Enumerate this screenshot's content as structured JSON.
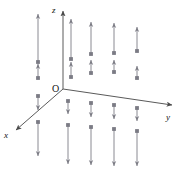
{
  "figure": {
    "title": "",
    "width": 187,
    "height": 187,
    "background_color": "#ffffff"
  },
  "colors": {
    "axis": "#5a5a5a",
    "vector": "#8a8a92",
    "vector_head": "#7b7b84",
    "label": "#111111"
  },
  "chart_data": {
    "type": "scatter",
    "title": "",
    "subtitle": "",
    "xlabel": "x",
    "ylabel": "y",
    "zlabel": "z",
    "grid": false,
    "legend": null,
    "annotations": [
      {
        "name": "origin",
        "text": "O",
        "x": 57,
        "y": 93
      },
      {
        "name": "z-axis-label",
        "text": "z",
        "x": 53,
        "y": 10
      },
      {
        "name": "y-axis-label",
        "text": "y",
        "x": 168,
        "y": 118
      },
      {
        "name": "x-axis-label",
        "text": "x",
        "x": 6,
        "y": 137
      }
    ],
    "axes": [
      {
        "name": "z-axis",
        "x1": 63,
        "y1": 89,
        "x2": 63,
        "y2": 8,
        "arrow": "end"
      },
      {
        "name": "y-axis",
        "x1": 63,
        "y1": 89,
        "x2": 176,
        "y2": 106,
        "arrow": "end"
      },
      {
        "name": "x-axis",
        "x1": 63,
        "y1": 89,
        "x2": 13,
        "y2": 133,
        "arrow": "end"
      }
    ],
    "vectors": [
      {
        "x": 38,
        "y_tail": 62,
        "y_tip": 14,
        "dir": "up",
        "length": 48
      },
      {
        "x": 38,
        "y_tail": 78,
        "y_tip": 64,
        "dir": "up",
        "length": 14
      },
      {
        "x": 71,
        "y_tail": 59,
        "y_tip": 19,
        "dir": "up",
        "length": 40
      },
      {
        "x": 71,
        "y_tail": 77,
        "y_tip": 62,
        "dir": "up",
        "length": 15
      },
      {
        "x": 91,
        "y_tail": 54,
        "y_tip": 22,
        "dir": "up",
        "length": 32
      },
      {
        "x": 91,
        "y_tail": 73,
        "y_tip": 60,
        "dir": "up",
        "length": 13
      },
      {
        "x": 114,
        "y_tail": 53,
        "y_tip": 23,
        "dir": "up",
        "length": 30
      },
      {
        "x": 114,
        "y_tail": 72,
        "y_tip": 60,
        "dir": "up",
        "length": 12
      },
      {
        "x": 137,
        "y_tail": 51,
        "y_tip": 27,
        "dir": "up",
        "length": 24
      },
      {
        "x": 137,
        "y_tail": 78,
        "y_tip": 66,
        "dir": "up",
        "length": 12
      },
      {
        "x": 38,
        "y_tail": 96,
        "y_tip": 110,
        "dir": "down",
        "length": 14
      },
      {
        "x": 38,
        "y_tail": 122,
        "y_tip": 156,
        "dir": "down",
        "length": 34
      },
      {
        "x": 68,
        "y_tail": 101,
        "y_tip": 114,
        "dir": "down",
        "length": 13
      },
      {
        "x": 68,
        "y_tail": 125,
        "y_tip": 164,
        "dir": "down",
        "length": 39
      },
      {
        "x": 91,
        "y_tail": 103,
        "y_tip": 117,
        "dir": "down",
        "length": 14
      },
      {
        "x": 91,
        "y_tail": 127,
        "y_tip": 165,
        "dir": "down",
        "length": 38
      },
      {
        "x": 114,
        "y_tail": 105,
        "y_tip": 119,
        "dir": "down",
        "length": 14
      },
      {
        "x": 114,
        "y_tail": 129,
        "y_tip": 166,
        "dir": "down",
        "length": 37
      },
      {
        "x": 137,
        "y_tail": 108,
        "y_tip": 121,
        "dir": "down",
        "length": 13
      },
      {
        "x": 137,
        "y_tail": 131,
        "y_tip": 166,
        "dir": "down",
        "length": 35
      }
    ]
  }
}
